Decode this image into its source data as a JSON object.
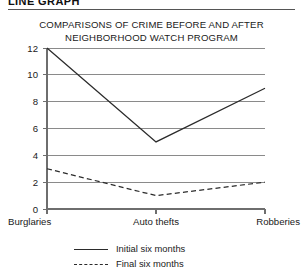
{
  "header": {
    "title": "LINE GRAPH"
  },
  "chart_title": {
    "line1": "COMPARISONS OF CRIME BEFORE AND AFTER",
    "line2": "NEIGHBORHOOD WATCH PROGRAM"
  },
  "legend": {
    "items": [
      {
        "label": "Initial six months",
        "style": "solid"
      },
      {
        "label": "Final six months",
        "style": "dashed"
      }
    ]
  },
  "colors": {
    "line": "#2b2b2b",
    "grid": "#8a8a8a",
    "axis": "#6e6e6e",
    "text": "#1a1a1a",
    "background": "#ffffff"
  },
  "chart_data": {
    "type": "line",
    "title": "COMPARISONS OF CRIME BEFORE AND AFTER NEIGHBORHOOD WATCH PROGRAM",
    "xlabel": "",
    "ylabel": "",
    "categories": [
      "Burglaries",
      "Auto thefts",
      "Robberies"
    ],
    "series": [
      {
        "name": "Initial six months",
        "style": "solid",
        "values": [
          12,
          5,
          9
        ]
      },
      {
        "name": "Final six months",
        "style": "dashed",
        "values": [
          3,
          1,
          2
        ]
      }
    ],
    "ylim": [
      0,
      12
    ],
    "yticks": [
      0,
      2,
      4,
      6,
      8,
      10,
      12
    ],
    "ytick_labels": [
      "0",
      "2",
      "4",
      "6",
      "8",
      "10",
      "12"
    ],
    "grid": true,
    "grid_axis": "y",
    "legend_position": "bottom"
  }
}
